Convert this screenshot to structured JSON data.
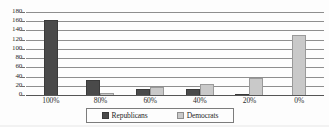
{
  "chart_data": {
    "type": "bar",
    "title": "",
    "subtitle": "",
    "xlabel": "",
    "ylabel": "",
    "ylim": [
      0,
      180
    ],
    "ytick_step": 20,
    "ytick_labels": [
      "180",
      "160",
      "140",
      "120",
      "100",
      "80",
      "60",
      "40",
      "20",
      "0"
    ],
    "grid": true,
    "grid_orientation": "horizontal",
    "legend_position": "bottom",
    "categories": [
      "100%",
      "80%",
      "60%",
      "40%",
      "20%",
      "0%"
    ],
    "series": [
      {
        "name": "Republicans",
        "color": "#4a4a4a",
        "values": [
          163,
          32,
          14,
          12,
          2,
          0
        ]
      },
      {
        "name": "Democrats",
        "color": "#c9c9c9",
        "values": [
          0,
          4,
          17,
          23,
          36,
          130
        ]
      }
    ]
  },
  "legend": {
    "entries": [
      {
        "label": "Republicans",
        "swatch": "dark-gray-swatch"
      },
      {
        "label": "Democrats",
        "swatch": "light-gray-swatch"
      }
    ]
  },
  "colors": {
    "republicans": "#4a4a4a",
    "democrats": "#c9c9c9",
    "gridline": "#8e8e8e",
    "axis": "#555555",
    "text": "#2b2b2b",
    "background": "#fdfdfd"
  }
}
